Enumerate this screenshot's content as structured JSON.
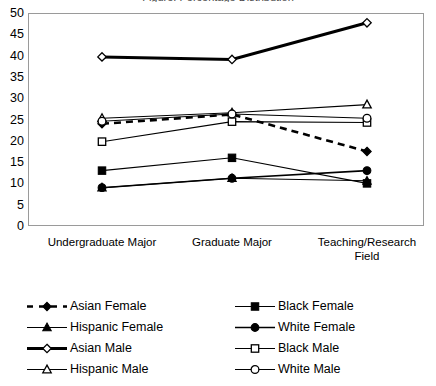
{
  "chart_title": "Figure: Percentage Distribution",
  "chart_data": {
    "type": "line",
    "title": "",
    "xlabel": "",
    "ylabel": "",
    "ylim": [
      0,
      50
    ],
    "ytick_step": 5,
    "grid": false,
    "legend_position": "bottom",
    "categories": [
      "Undergraduate Major",
      "Graduate Major",
      "Teaching/Research Field"
    ],
    "ytick_labels": [
      "50",
      "45",
      "40",
      "35",
      "30",
      "25",
      "20",
      "15",
      "10",
      "5",
      "0"
    ],
    "ytick_values": [
      50,
      45,
      40,
      35,
      30,
      25,
      20,
      15,
      10,
      5,
      0
    ],
    "series": [
      {
        "name": "Asian Female",
        "values": [
          24.0,
          26.2,
          17.5
        ],
        "marker": "filled-diamond",
        "line_style": "dashed",
        "line_width": 2.6,
        "color": "#000000"
      },
      {
        "name": "Black Female",
        "values": [
          13.0,
          16.0,
          10.0
        ],
        "marker": "filled-square",
        "line_style": "solid",
        "line_width": 1.1,
        "color": "#000000"
      },
      {
        "name": "Hispanic Female",
        "values": [
          9.0,
          11.2,
          10.6
        ],
        "marker": "filled-triangle",
        "line_style": "solid",
        "line_width": 1.1,
        "color": "#000000"
      },
      {
        "name": "White Female",
        "values": [
          9.0,
          11.2,
          13.0
        ],
        "marker": "filled-circle",
        "line_style": "solid",
        "line_width": 1.6,
        "color": "#000000"
      },
      {
        "name": "Asian Male",
        "values": [
          39.7,
          39.1,
          47.7
        ],
        "marker": "open-diamond",
        "line_style": "solid",
        "line_width": 3.0,
        "color": "#000000"
      },
      {
        "name": "Black Male",
        "values": [
          19.8,
          24.5,
          24.3
        ],
        "marker": "open-square",
        "line_style": "solid",
        "line_width": 1.1,
        "color": "#000000"
      },
      {
        "name": "Hispanic Male",
        "values": [
          25.3,
          26.6,
          28.5
        ],
        "marker": "open-triangle",
        "line_style": "solid",
        "line_width": 1.1,
        "color": "#000000"
      },
      {
        "name": "White Male",
        "values": [
          24.6,
          26.3,
          25.3
        ],
        "marker": "open-circle",
        "line_style": "solid",
        "line_width": 1.1,
        "color": "#000000"
      }
    ]
  },
  "legend": {
    "entries": [
      {
        "label": "Asian Female",
        "marker": "filled-diamond",
        "line_style": "dashed",
        "line_width": 2.6,
        "col": 0,
        "row": 0
      },
      {
        "label": "Black Female",
        "marker": "filled-square",
        "line_style": "solid",
        "line_width": 1.2,
        "col": 1,
        "row": 0
      },
      {
        "label": "Hispanic Female",
        "marker": "filled-triangle",
        "line_style": "solid",
        "line_width": 1.2,
        "col": 0,
        "row": 1
      },
      {
        "label": "White Female",
        "marker": "filled-circle",
        "line_style": "solid",
        "line_width": 1.6,
        "col": 1,
        "row": 1
      },
      {
        "label": "Asian Male",
        "marker": "open-diamond",
        "line_style": "solid",
        "line_width": 3.0,
        "col": 0,
        "row": 2
      },
      {
        "label": "Black Male",
        "marker": "open-square",
        "line_style": "solid",
        "line_width": 1.2,
        "col": 1,
        "row": 2
      },
      {
        "label": "Hispanic Male",
        "marker": "open-triangle",
        "line_style": "solid",
        "line_width": 1.2,
        "col": 0,
        "row": 3
      },
      {
        "label": "White Male",
        "marker": "open-circle",
        "line_style": "solid",
        "line_width": 1.2,
        "col": 1,
        "row": 3
      }
    ]
  },
  "plot_area": {
    "left": 28,
    "top": 13,
    "right": 424,
    "bottom": 226,
    "border_color": "#9a9a9a"
  }
}
